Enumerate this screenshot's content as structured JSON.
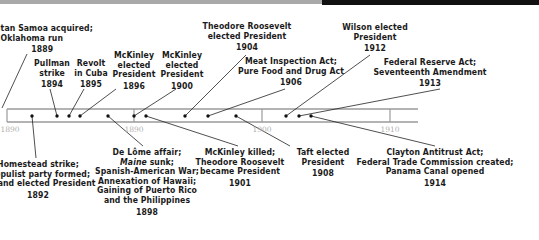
{
  "timeline": {
    "range": [
      1889,
      1915
    ],
    "ticks": [
      {
        "label": "1890",
        "x": 7
      },
      {
        "label": "1890",
        "x": 134
      },
      {
        "label": "1900",
        "x": 262
      },
      {
        "label": "1910",
        "x": 390
      }
    ],
    "colors": {
      "band": "#9a9a9a",
      "text": "#1a1a1a",
      "tick_text": "#b0b0b0",
      "topbar_gray": "#a9a9a9",
      "topbar_black": "#111111"
    }
  },
  "events_above": [
    {
      "year": "1889",
      "lines": [
        "...tan Samoa acquired;",
        "...Oklahoma run"
      ]
    },
    {
      "year": "1894",
      "lines": [
        "Pullman",
        "strike"
      ]
    },
    {
      "year": "1895",
      "lines": [
        "Revolt",
        "in Cuba"
      ]
    },
    {
      "year": "1896",
      "lines": [
        "McKinley",
        "elected",
        "President"
      ]
    },
    {
      "year": "1900",
      "lines": [
        "McKinley",
        "elected",
        "President"
      ]
    },
    {
      "year": "1904",
      "lines": [
        "Theodore Roosevelt",
        "elected President"
      ]
    },
    {
      "year": "1906",
      "lines": [
        "Meat Inspection Act;",
        "Pure Food and Drug Act"
      ]
    },
    {
      "year": "1912",
      "lines": [
        "Wilson elected",
        "President"
      ]
    },
    {
      "year": "1913",
      "lines": [
        "Federal Reserve Act;",
        "Seventeenth Amendment"
      ]
    }
  ],
  "events_below": [
    {
      "year": "1892",
      "lines": [
        "Homestead strike;",
        "...opulist party formed;",
        "...eland elected President"
      ]
    },
    {
      "year": "1898",
      "lines": [
        "De Lôme affair;",
        "Maine",
        " sunk;",
        "Spanish-American War;",
        "Annexation of Hawaii;",
        "Gaining of Puerto Rico",
        "and the Philippines"
      ]
    },
    {
      "year": "1901",
      "lines": [
        "McKinley killed;",
        "Theodore Roosevelt",
        "became President"
      ]
    },
    {
      "year": "1908",
      "lines": [
        "Taft elected",
        "President"
      ]
    },
    {
      "year": "1914",
      "lines": [
        "Clayton Antitrust Act;",
        "Federal Trade Commission created;",
        "Panama Canal opened"
      ]
    }
  ]
}
